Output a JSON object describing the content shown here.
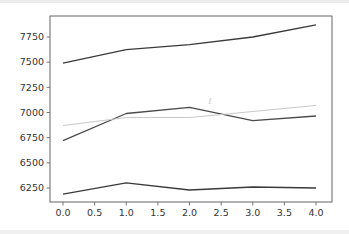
{
  "chart_data": {
    "type": "line",
    "title": "",
    "xlabel": "",
    "ylabel": "",
    "x": [
      0,
      1,
      2,
      3,
      4
    ],
    "xlim": [
      -0.2,
      4.2
    ],
    "ylim": [
      6100,
      7960
    ],
    "xticks": [
      "0.0",
      "0.5",
      "1.0",
      "1.5",
      "2.0",
      "2.5",
      "3.0",
      "3.5",
      "4.0"
    ],
    "yticks": [
      "6250",
      "6500",
      "6750",
      "7000",
      "7250",
      "7500",
      "7750"
    ],
    "grid": false,
    "legend": null,
    "series": [
      {
        "name": "series-1",
        "color": "#3a3a3a",
        "values": [
          7490,
          7625,
          7675,
          7750,
          7870
        ]
      },
      {
        "name": "series-2",
        "color": "#4a4a4a",
        "values": [
          6720,
          6990,
          7050,
          6920,
          6965
        ]
      },
      {
        "name": "series-3",
        "color": "#c8c8c8",
        "values": [
          6870,
          6950,
          6950,
          7010,
          7070
        ]
      },
      {
        "name": "series-4",
        "color": "#3a3a3a",
        "values": [
          6190,
          6300,
          6230,
          6260,
          6250
        ]
      }
    ],
    "annotations": [
      {
        "text": "ℓ",
        "x": 2.3,
        "y": 7080,
        "color": "#d0d0d0"
      }
    ]
  }
}
